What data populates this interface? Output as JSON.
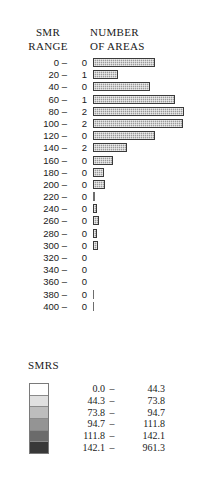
{
  "figure": {
    "headers": {
      "left_line1": "SMR",
      "left_line2": "RANGE",
      "right_line1": "NUMBER",
      "right_line2": "OF AREAS"
    }
  },
  "chart_data": {
    "type": "bar",
    "orientation": "horizontal",
    "title": "",
    "xlabel": "NUMBER OF AREAS",
    "ylabel": "SMR RANGE",
    "grid": false,
    "legend_position": "bottom-left",
    "categories": [
      "0 –",
      "20 –",
      "40 –",
      "60 –",
      "80 –",
      "100 –",
      "120 –",
      "140 –",
      "160 –",
      "180 –",
      "200 –",
      "220 –",
      "240 –",
      "260 –",
      "280 –",
      "300 –",
      "320 –",
      "340 –",
      "360 –",
      "380 –",
      "400 –"
    ],
    "count_labels": [
      "0",
      "1",
      "0",
      "1",
      "2",
      "2",
      "0",
      "2",
      "0",
      "0",
      "0",
      "0",
      "0",
      "0",
      "0",
      "0",
      "0",
      "0",
      "0",
      "0",
      "0"
    ],
    "bar_lengths_px": [
      62,
      25,
      57,
      82,
      91,
      90,
      62,
      34,
      20,
      11,
      12,
      2,
      4,
      6,
      4,
      5,
      0,
      0,
      0,
      1,
      1
    ],
    "rows": [
      {
        "range": "0 –",
        "count": "0",
        "bar": 62,
        "style": "filled"
      },
      {
        "range": "20 –",
        "count": "1",
        "bar": 25,
        "style": "filled"
      },
      {
        "range": "40 –",
        "count": "0",
        "bar": 57,
        "style": "filled"
      },
      {
        "range": "60 –",
        "count": "1",
        "bar": 82,
        "style": "filled"
      },
      {
        "range": "80 –",
        "count": "2",
        "bar": 91,
        "style": "filled"
      },
      {
        "range": "100 –",
        "count": "2",
        "bar": 90,
        "style": "filled"
      },
      {
        "range": "120 –",
        "count": "0",
        "bar": 62,
        "style": "filled"
      },
      {
        "range": "140 –",
        "count": "2",
        "bar": 34,
        "style": "filled"
      },
      {
        "range": "160 –",
        "count": "0",
        "bar": 20,
        "style": "filled"
      },
      {
        "range": "180 –",
        "count": "0",
        "bar": 11,
        "style": "filled"
      },
      {
        "range": "200 –",
        "count": "0",
        "bar": 12,
        "style": "filled"
      },
      {
        "range": "220 –",
        "count": "0",
        "bar": 2,
        "style": "hairline"
      },
      {
        "range": "240 –",
        "count": "0",
        "bar": 4,
        "style": "filled"
      },
      {
        "range": "260 –",
        "count": "0",
        "bar": 6,
        "style": "filled"
      },
      {
        "range": "280 –",
        "count": "0",
        "bar": 4,
        "style": "filled"
      },
      {
        "range": "300 –",
        "count": "0",
        "bar": 5,
        "style": "filled"
      },
      {
        "range": "320 –",
        "count": "0",
        "bar": 0,
        "style": "none"
      },
      {
        "range": "340 –",
        "count": "0",
        "bar": 0,
        "style": "none"
      },
      {
        "range": "360 –",
        "count": "0",
        "bar": 0,
        "style": "none"
      },
      {
        "range": "380 –",
        "count": "0",
        "bar": 1,
        "style": "hairline"
      },
      {
        "range": "400 –",
        "count": "0",
        "bar": 1,
        "style": "hairline"
      }
    ]
  },
  "legend": {
    "title": "SMRS",
    "classes": [
      {
        "low": "0.0",
        "dash": "–",
        "high": "44.3",
        "color": "#ffffff"
      },
      {
        "low": "44.3",
        "dash": "–",
        "high": "73.8",
        "color": "#e0e0e0"
      },
      {
        "low": "73.8",
        "dash": "–",
        "high": "94.7",
        "color": "#bdbdbd"
      },
      {
        "low": "94.7",
        "dash": "–",
        "high": "111.8",
        "color": "#949494"
      },
      {
        "low": "111.8",
        "dash": "–",
        "high": "142.1",
        "color": "#6b6b6b"
      },
      {
        "low": "142.1",
        "dash": "–",
        "high": "961.3",
        "color": "#383838"
      }
    ]
  }
}
